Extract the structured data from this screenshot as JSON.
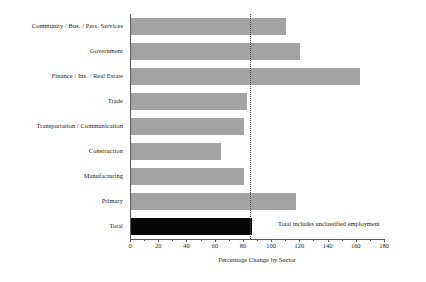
{
  "chart_data": {
    "type": "bar",
    "orientation": "horizontal",
    "title": "",
    "xlabel": "Percentage Change by Sector",
    "ylabel": "",
    "xlim": [
      0,
      180
    ],
    "xticks": [
      0,
      20,
      40,
      60,
      80,
      100,
      120,
      140,
      160,
      180
    ],
    "xtick_labels": [
      "0",
      "20",
      "40",
      "60",
      "80",
      "100",
      "120",
      "140",
      "160",
      "180"
    ],
    "minor_ticks": [
      10,
      30,
      50,
      70,
      90,
      110,
      130,
      150,
      170
    ],
    "grid": false,
    "legend": null,
    "categories": [
      "Community / Bus. / Pers. Services",
      "Government",
      "Finance / Ins. / Real Estate",
      "Trade",
      "Transportation / Communication",
      "Construction",
      "Manufacturing",
      "Primary",
      "Total"
    ],
    "values": [
      110,
      120,
      162,
      82,
      80,
      64,
      80,
      117,
      86
    ],
    "bar_colors": [
      "#a3a3a3",
      "#a3a3a3",
      "#a3a3a3",
      "#a3a3a3",
      "#a3a3a3",
      "#a3a3a3",
      "#a3a3a3",
      "#a3a3a3",
      "#050505"
    ],
    "reference_line": {
      "value": 85,
      "style": "dotted",
      "color": "#4a4a4a"
    },
    "annotations": [
      {
        "text": "Total includes unclassified employment",
        "x": 105,
        "y": "Total"
      }
    ]
  },
  "colors": {
    "bar_gray": "#a3a3a3",
    "bar_black": "#050505",
    "axis": "#5a5a5a",
    "text": "#1a1a1a",
    "background": "#ffffff"
  }
}
